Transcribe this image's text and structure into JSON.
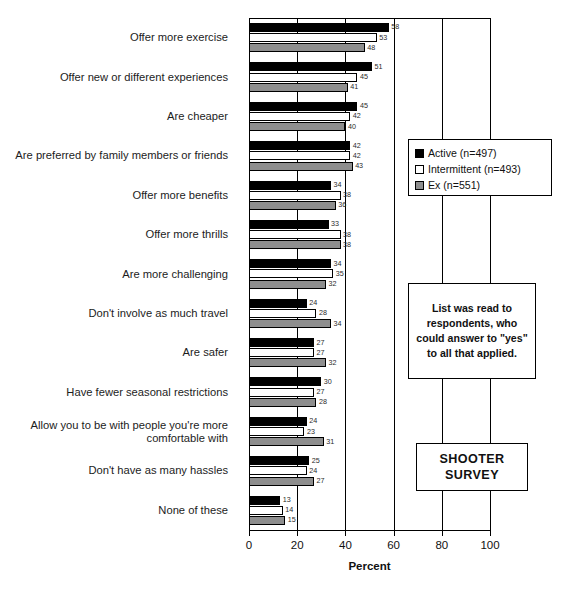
{
  "chart_data": {
    "type": "bar",
    "orientation": "horizontal",
    "title": "",
    "xlabel": "Percent",
    "ylabel": "",
    "xlim": [
      0,
      100
    ],
    "xticks": [
      0,
      20,
      40,
      60,
      80,
      100
    ],
    "grid": true,
    "legend_position": "right",
    "categories": [
      "Offer more exercise",
      "Offer new or different experiences",
      "Are cheaper",
      "Are preferred by family members or friends",
      "Offer more benefits",
      "Offer more thrills",
      "Are more challenging",
      "Don't involve as much travel",
      "Are safer",
      "Have fewer seasonal restrictions",
      "Allow you to be with people you're more comfortable with",
      "Don't have as many hassles",
      "None of these"
    ],
    "series": [
      {
        "name": "Active (n=497)",
        "key": "active",
        "color": "#000000",
        "values": [
          58,
          51,
          45,
          42,
          34,
          33,
          34,
          24,
          27,
          30,
          24,
          25,
          13
        ]
      },
      {
        "name": "Intermittent (n=493)",
        "key": "intermittent",
        "color": "#ffffff",
        "values": [
          53,
          45,
          42,
          42,
          38,
          38,
          35,
          28,
          27,
          27,
          23,
          24,
          14
        ]
      },
      {
        "name": "Ex (n=551)",
        "key": "ex",
        "color": "#8e8e8e",
        "values": [
          48,
          41,
          40,
          43,
          36,
          38,
          32,
          34,
          32,
          28,
          31,
          27,
          15
        ]
      }
    ]
  },
  "legend": {
    "items": [
      {
        "label": "Active (n=497)",
        "swatch": "active"
      },
      {
        "label": "Intermittent (n=493)",
        "swatch": "intermittent"
      },
      {
        "label": "Ex (n=551)",
        "swatch": "ex"
      }
    ]
  },
  "note_box": {
    "text": "List was read to respondents, who could answer to \"yes\" to all that applied."
  },
  "survey_box": {
    "line1": "SHOOTER",
    "line2": "SURVEY"
  },
  "axis": {
    "title": "Percent",
    "ticks": [
      "0",
      "20",
      "40",
      "60",
      "80",
      "100"
    ]
  },
  "caption": {
    "text": ""
  }
}
